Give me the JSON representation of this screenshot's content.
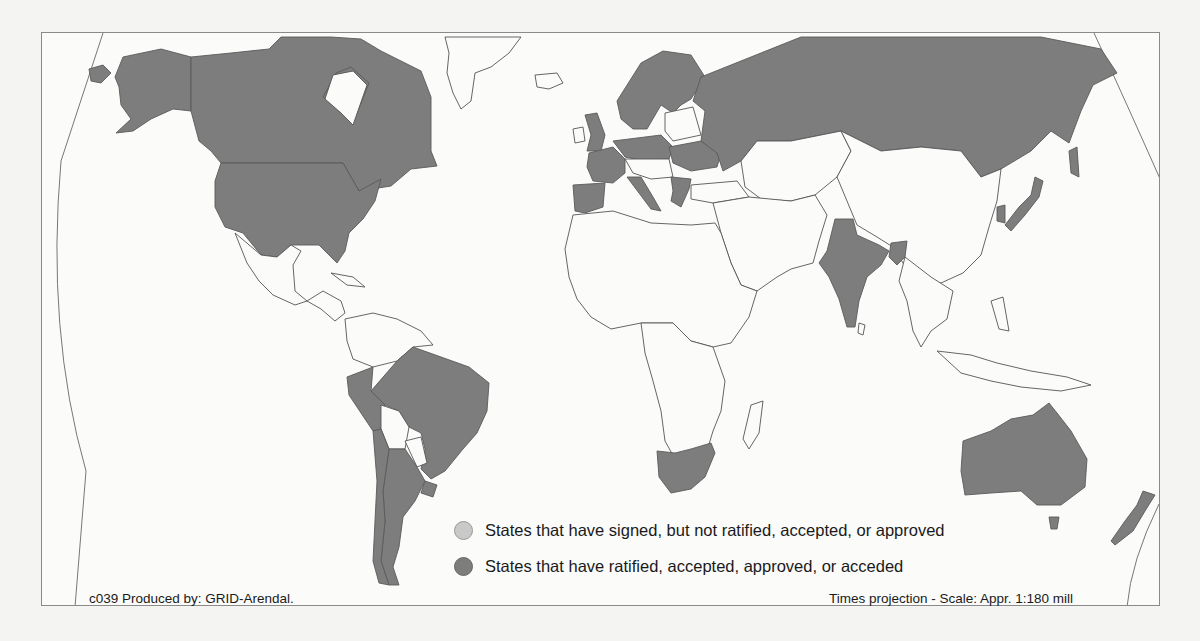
{
  "map": {
    "type": "choropleth",
    "projection_note": "Times projection - Scale: Appr. 1:180 mill",
    "credit": "c039 Produced by: GRID-Arendal.",
    "colors": {
      "ratified": "#7d7d7d",
      "signed": "#c9c9c9",
      "none": "#fbfbfa",
      "background": "#f4f4f2"
    },
    "legend": [
      {
        "key": "signed",
        "label": "States that have signed, but not ratified, accepted, or approved",
        "color": "#c9c9c9"
      },
      {
        "key": "ratified",
        "label": "States that have ratified, accepted, approved, or acceded",
        "color": "#7d7d7d"
      }
    ],
    "ratified_states": [
      "Canada",
      "United States",
      "Brazil",
      "Peru",
      "Chile",
      "Argentina",
      "Uruguay",
      "French Guiana",
      "United Kingdom",
      "France",
      "Spain",
      "Portugal",
      "Netherlands",
      "Belgium",
      "Germany",
      "Norway",
      "Sweden",
      "Finland",
      "Denmark",
      "Poland",
      "Ukraine",
      "Italy",
      "Austria",
      "Bulgaria",
      "Greece",
      "Russia",
      "India",
      "Bangladesh",
      "South Korea",
      "Japan",
      "South Africa",
      "Australia",
      "New Zealand"
    ],
    "signed_states": []
  }
}
